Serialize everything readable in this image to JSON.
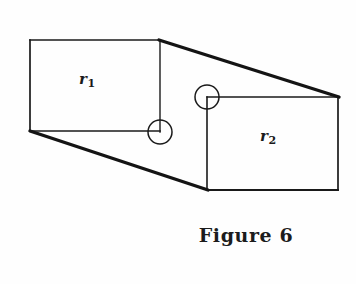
{
  "figure": {
    "caption": "Figure 6",
    "background_color": "#fefefe",
    "ink_color": "#1a1a1a",
    "width": 356,
    "height": 284
  },
  "labels": {
    "r1": {
      "base": "r",
      "subscript": "1"
    },
    "r2": {
      "base": "r",
      "subscript": "2"
    }
  },
  "diagram": {
    "type": "line-drawing",
    "stroke_thin": 1.4,
    "stroke_thick": 3.0,
    "rectangles": [
      {
        "name": "r1",
        "x": 30,
        "y": 40,
        "width": 130,
        "height": 91,
        "stroke_weights": {
          "top": 1.6,
          "right": 1.4,
          "bottom": 1.6,
          "left": 1.6
        }
      },
      {
        "name": "r2",
        "x": 207,
        "y": 97,
        "width": 131,
        "height": 93,
        "stroke_weights": {
          "top": 1.4,
          "right": 1.6,
          "bottom": 1.8,
          "left": 1.6
        }
      }
    ],
    "connector_edges": [
      {
        "name": "upper-diagonal",
        "x1": 160,
        "y1": 40,
        "x2": 338,
        "y2": 97,
        "stroke": 3.2
      },
      {
        "name": "lower-diagonal",
        "x1": 30,
        "y1": 131,
        "x2": 207,
        "y2": 190,
        "stroke": 3.2
      }
    ],
    "circles": [
      {
        "name": "corner-circle-r1",
        "cx": 160,
        "cy": 132,
        "r": 12,
        "stroke": 1.5
      },
      {
        "name": "corner-circle-r2",
        "cx": 207,
        "cy": 97,
        "r": 12,
        "stroke": 1.5
      }
    ]
  }
}
